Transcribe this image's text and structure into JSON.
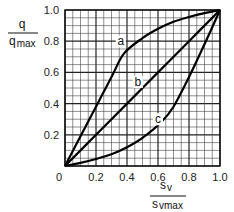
{
  "chart_data": {
    "type": "line",
    "title": "",
    "xlabel": "s_v / s_vmax",
    "ylabel": "q / q_max",
    "xlabel_num": "s",
    "xlabel_num_sub": "v",
    "xlabel_den": "s",
    "xlabel_den_sub": "vmax",
    "ylabel_num": "q",
    "ylabel_den": "q",
    "ylabel_den_sub": "max",
    "xlim": [
      0,
      1.0
    ],
    "ylim": [
      0,
      1.0
    ],
    "grid": true,
    "grid_minor_step": 0.05,
    "grid_major_step": 0.2,
    "x_ticks": [
      "0",
      "0.2",
      "0.4",
      "0.6",
      "0.8",
      "1.0"
    ],
    "y_ticks": [
      "0.2",
      "0.4",
      "0.6",
      "0.8",
      "1.0"
    ],
    "origin_label": "0",
    "legend": "none (inline curve labels)",
    "series": [
      {
        "name": "a",
        "x": [
          0,
          0.1,
          0.2,
          0.3,
          0.38,
          0.5,
          0.6,
          0.7,
          0.8,
          0.9,
          1.0
        ],
        "y": [
          0,
          0.19,
          0.38,
          0.57,
          0.72,
          0.82,
          0.88,
          0.925,
          0.955,
          0.98,
          1.0
        ],
        "label_pos": [
          0.36,
          0.78
        ]
      },
      {
        "name": "b",
        "x": [
          0,
          0.2,
          0.4,
          0.6,
          0.8,
          1.0
        ],
        "y": [
          0,
          0.2,
          0.4,
          0.6,
          0.8,
          1.0
        ],
        "label_pos": [
          0.47,
          0.52
        ]
      },
      {
        "name": "c",
        "x": [
          0,
          0.1,
          0.2,
          0.3,
          0.4,
          0.5,
          0.62,
          0.7,
          0.8,
          0.9,
          1.0
        ],
        "y": [
          0,
          0.02,
          0.045,
          0.075,
          0.12,
          0.18,
          0.28,
          0.38,
          0.57,
          0.78,
          1.0
        ],
        "label_pos": [
          0.6,
          0.28
        ]
      }
    ]
  }
}
